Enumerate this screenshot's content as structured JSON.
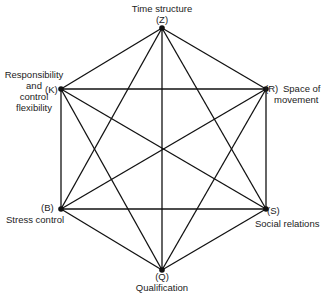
{
  "diagram": {
    "type": "complete-hexagon-graph",
    "line_color": "#111111",
    "nodes": [
      {
        "id": "Z",
        "code": "(Z)",
        "label": "Time structure",
        "x": 162,
        "y": 28
      },
      {
        "id": "R",
        "code": "(R)",
        "label": "Space of movement",
        "label_line1": "Space of",
        "label_line2": "movement",
        "x": 266,
        "y": 89
      },
      {
        "id": "S",
        "code": "(S)",
        "label": "Social relations",
        "x": 266,
        "y": 209
      },
      {
        "id": "Q",
        "code": "(Q)",
        "label": "Qualification",
        "x": 162,
        "y": 270
      },
      {
        "id": "B",
        "code": "(B)",
        "label": "Stress control",
        "x": 61,
        "y": 209
      },
      {
        "id": "K",
        "code": "(K)",
        "label": "Responsibility and control flexibility",
        "label_line1": "Responsibility",
        "label_line2": "and",
        "label_line3": "control",
        "label_line4": "flexibility",
        "x": 61,
        "y": 89
      }
    ],
    "edges": [
      [
        "Z",
        "R"
      ],
      [
        "Z",
        "S"
      ],
      [
        "Z",
        "Q"
      ],
      [
        "Z",
        "B"
      ],
      [
        "Z",
        "K"
      ],
      [
        "R",
        "S"
      ],
      [
        "R",
        "Q"
      ],
      [
        "R",
        "B"
      ],
      [
        "R",
        "K"
      ],
      [
        "S",
        "Q"
      ],
      [
        "S",
        "B"
      ],
      [
        "S",
        "K"
      ],
      [
        "Q",
        "B"
      ],
      [
        "Q",
        "K"
      ],
      [
        "B",
        "K"
      ]
    ]
  }
}
